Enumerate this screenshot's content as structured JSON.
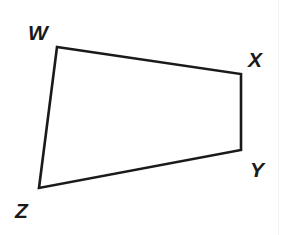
{
  "diagram": {
    "type": "quadrilateral",
    "name": "WXYZ",
    "stroke_color": "#1a1a1a",
    "background": "#ffffff",
    "vertices": [
      {
        "label": "W",
        "x": 57,
        "y": 47,
        "label_x": 28,
        "label_y": 40
      },
      {
        "label": "X",
        "x": 241,
        "y": 74,
        "label_x": 248,
        "label_y": 67
      },
      {
        "label": "Y",
        "x": 241,
        "y": 150,
        "label_x": 250,
        "label_y": 177
      },
      {
        "label": "Z",
        "x": 39,
        "y": 188,
        "label_x": 15,
        "label_y": 218
      }
    ],
    "edges": [
      {
        "from": "W",
        "to": "X"
      },
      {
        "from": "X",
        "to": "Y"
      },
      {
        "from": "Y",
        "to": "Z"
      },
      {
        "from": "Z",
        "to": "W"
      }
    ]
  }
}
